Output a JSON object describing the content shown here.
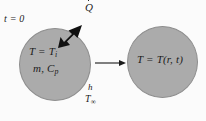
{
  "figure": {
    "type": "heat-transfer-schematic",
    "background_color": "#fbfbfb",
    "sphere_fill_color": "#ababab",
    "sphere_stroke_color": "#8e8e8e",
    "text_color": "#1b1b1b",
    "arrow_color": "#111111"
  },
  "left_sphere": {
    "time_label": "t = 0",
    "temperature_label_main": "T = T",
    "temperature_label_sub": "i",
    "mass_heat_label_main": "m, C",
    "mass_heat_label_sub": "p",
    "coefficient_label": "h",
    "ambient_label_main": "T",
    "ambient_label_sub": "∞"
  },
  "heat_arrow": {
    "label_symbol": "Q",
    "label_full": "Q̇",
    "direction": "up-right",
    "style": "thick-filled"
  },
  "transition_arrow": {
    "direction": "right",
    "style": "thin-line"
  },
  "right_sphere": {
    "temperature_label": "T = T(r, t)"
  }
}
